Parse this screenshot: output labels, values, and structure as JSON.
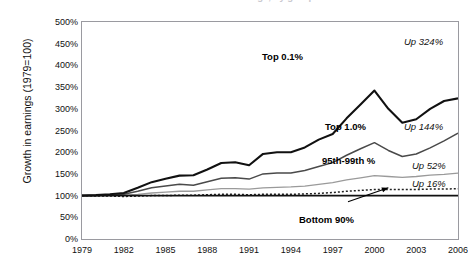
{
  "title": "Growth in earnings, by group",
  "axes": {
    "ylabel": "Growth in earnings (1979=100)",
    "yticks": [
      "500%",
      "450%",
      "400%",
      "350%",
      "300%",
      "250%",
      "200%",
      "150%",
      "100%",
      "50%",
      "0%"
    ],
    "xticks": [
      "1979",
      "1982",
      "1985",
      "1988",
      "1991",
      "1994",
      "1997",
      "2000",
      "2003",
      "2006"
    ]
  },
  "series_labels": {
    "top01": "Top 0.1%",
    "top10": "Top 1.0%",
    "p95_99": "95th-99th %",
    "bottom90": "Bottom 90%"
  },
  "end_annotations": {
    "top01": "Up 324%",
    "top10": "Up 144%",
    "p95_99": "Up 52%",
    "bottom90": "Up 16%"
  },
  "colors": {
    "top01": "#111111",
    "top10": "#4a4a4a",
    "p95_99": "#9a9a9a",
    "bottom90": "#222222",
    "baseline": "#111111",
    "frame": "#9a9aa0"
  },
  "chart_data": {
    "type": "line",
    "title": "Growth in earnings, by group",
    "xlabel": "",
    "ylabel": "Growth in earnings (1979=100)",
    "ylim": [
      0,
      500
    ],
    "xlim": [
      1979,
      2006
    ],
    "grid": false,
    "legend": "inline-annotations",
    "x": [
      1979,
      1980,
      1981,
      1982,
      1983,
      1984,
      1985,
      1986,
      1987,
      1988,
      1989,
      1990,
      1991,
      1992,
      1993,
      1994,
      1995,
      1996,
      1997,
      1998,
      1999,
      2000,
      2001,
      2002,
      2003,
      2004,
      2005,
      2006
    ],
    "series": [
      {
        "name": "Top 0.1%",
        "end_label": "Up 324%",
        "values": [
          100,
          101,
          103,
          106,
          118,
          131,
          139,
          146,
          147,
          160,
          175,
          177,
          170,
          196,
          200,
          200,
          211,
          229,
          242,
          278,
          310,
          342,
          300,
          268,
          276,
          300,
          318,
          324
        ]
      },
      {
        "name": "Top 1.0%",
        "end_label": "Up 144%",
        "values": [
          100,
          100,
          101,
          103,
          110,
          118,
          122,
          126,
          124,
          132,
          140,
          141,
          138,
          150,
          152,
          152,
          158,
          167,
          176,
          193,
          208,
          222,
          204,
          190,
          196,
          210,
          226,
          244
        ]
      },
      {
        "name": "95th-99th %",
        "end_label": "Up 52%",
        "values": [
          100,
          100,
          100,
          101,
          103,
          106,
          108,
          110,
          110,
          113,
          116,
          116,
          115,
          118,
          119,
          120,
          122,
          126,
          130,
          136,
          141,
          146,
          144,
          142,
          144,
          147,
          149,
          152
        ]
      },
      {
        "name": "Bottom 90%",
        "end_label": "Up 16%",
        "values": [
          100,
          99,
          99,
          98,
          99,
          100,
          100,
          101,
          101,
          102,
          103,
          103,
          102,
          103,
          103,
          103,
          104,
          105,
          107,
          110,
          112,
          114,
          114,
          114,
          114,
          115,
          115,
          116
        ]
      }
    ],
    "baseline": {
      "value": 100,
      "style": "solid-black"
    }
  }
}
